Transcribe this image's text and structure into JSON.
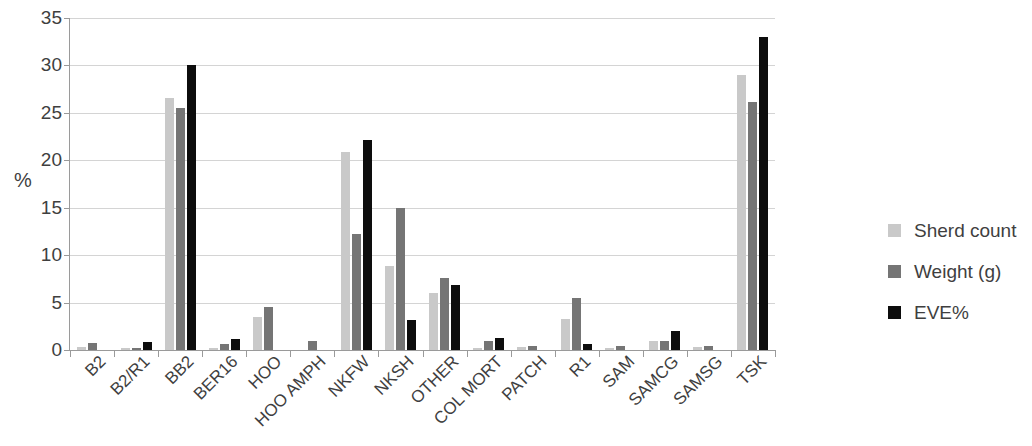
{
  "chart_data": {
    "type": "bar",
    "title": "",
    "xlabel": "",
    "ylabel": "%",
    "ylim": [
      0,
      35
    ],
    "yticks": [
      0,
      5,
      10,
      15,
      20,
      25,
      30,
      35
    ],
    "grid": true,
    "legend_position": "right",
    "categories": [
      "B2",
      "B2/R1",
      "BB2",
      "BER16",
      "HOO",
      "HOO AMPH",
      "NKFW",
      "NKSH",
      "OTHER",
      "COL MORT",
      "PATCH",
      "R1",
      "SAM",
      "SAMCG",
      "SAMSG",
      "TSK"
    ],
    "series": [
      {
        "name": "Sherd count",
        "color": "#c9c9c9",
        "values": [
          0.3,
          0.2,
          26.6,
          0.2,
          3.5,
          0.0,
          20.9,
          8.9,
          6.0,
          0.2,
          0.3,
          3.3,
          0.2,
          0.9,
          0.3,
          29.0
        ]
      },
      {
        "name": "Weight (g)",
        "color": "#757575",
        "values": [
          0.7,
          0.2,
          25.5,
          0.6,
          4.5,
          1.0,
          12.2,
          15.0,
          7.6,
          1.0,
          0.4,
          5.5,
          0.4,
          0.9,
          0.4,
          26.1
        ]
      },
      {
        "name": "EVE%",
        "color": "#0d0d0d",
        "values": [
          0.0,
          0.8,
          30.0,
          1.2,
          0.0,
          0.0,
          22.1,
          3.2,
          6.9,
          1.3,
          0.0,
          0.6,
          0.0,
          2.0,
          0.0,
          33.0
        ]
      }
    ]
  },
  "legend": {
    "items": [
      {
        "label": "Sherd count",
        "color": "#c9c9c9"
      },
      {
        "label": "Weight (g)",
        "color": "#757575"
      },
      {
        "label": "EVE%",
        "color": "#0d0d0d"
      }
    ]
  },
  "axes": {
    "y_title": "%"
  }
}
